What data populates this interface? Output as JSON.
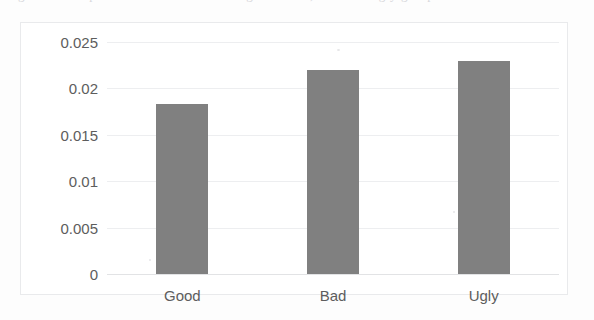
{
  "page": {
    "background_color": "#fdfdfd",
    "cut_off_caption_sliver": "Figure 3. Comparison of error rates among the Good, Bad and Ugly groups"
  },
  "chart_frame": {
    "border_color": "#e9eaec",
    "plot_background": "#ffffff"
  },
  "chart_data": {
    "type": "bar",
    "title": "",
    "subtitle": "",
    "xlabel": "",
    "ylabel": "",
    "categories": [
      "Good",
      "Bad",
      "Ugly"
    ],
    "values": [
      0.0183,
      0.022,
      0.023
    ],
    "series": [
      {
        "name": "",
        "values": [
          0.0183,
          0.022,
          0.023
        ]
      }
    ],
    "ylim": [
      0,
      0.025
    ],
    "ytick_labels": [
      "0.025",
      "0.02",
      "0.015",
      "0.01",
      "0.005",
      "0"
    ],
    "ytick_values": [
      0.025,
      0.02,
      0.015,
      0.01,
      0.005,
      0
    ],
    "grid": true,
    "grid_axis": "y",
    "grid_color": "#edeef0",
    "legend": false,
    "legend_position": "none",
    "bar_color": "#808080",
    "bar_width_px": 52,
    "annotations": []
  }
}
